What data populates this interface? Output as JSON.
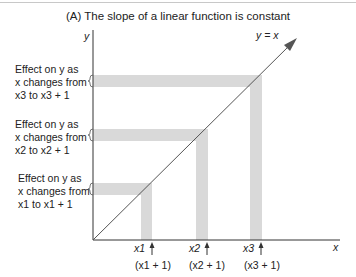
{
  "title": "(A) The slope of a linear function is constant",
  "axes": {
    "x_label": "x",
    "y_label": "y"
  },
  "line_label": "y = x",
  "effects": [
    {
      "line1": "Effect on y as",
      "line2": "x changes from",
      "line3": "x3 to x3 + 1",
      "var": "x",
      "sub": "3"
    },
    {
      "line1": "Effect on y  as",
      "line2": "x changes from",
      "line3": "x2 to x2 + 1",
      "var": "x",
      "sub": "2"
    },
    {
      "line1": "Effect on y  as",
      "line2": "x changes from",
      "line3": "x1 to x1 + 1",
      "var": "x",
      "sub": "1"
    }
  ],
  "x_ticks": [
    {
      "label": "x1",
      "next": "(x1 + 1)",
      "sub": "1"
    },
    {
      "label": "x2",
      "next": "(x2 + 1)",
      "sub": "2"
    },
    {
      "label": "x3",
      "next": "(x3 + 1)",
      "sub": "3"
    }
  ],
  "colors": {
    "band": "#d9d9d9",
    "line": "#555555",
    "axis": "#333333"
  }
}
